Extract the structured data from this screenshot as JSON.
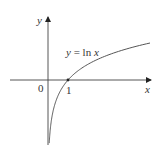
{
  "chart_data": {
    "type": "line",
    "title": "",
    "function": "y = ln x",
    "xlabel": "x",
    "ylabel": "y",
    "origin_label": "0",
    "x_ticks": [
      {
        "value": 1,
        "label": "1"
      }
    ],
    "annotation": {
      "text": "y = ln x"
    },
    "series": [
      {
        "name": "y = ln x",
        "x": [
          0.062,
          0.1,
          0.2,
          0.3,
          0.5,
          0.75,
          1,
          1.5,
          2,
          2.5,
          3,
          3.5,
          4,
          4.5,
          5.1
        ],
        "y": [
          -2.78,
          -2.3,
          -1.61,
          -1.2,
          -0.69,
          -0.29,
          0,
          0.41,
          0.69,
          0.92,
          1.1,
          1.25,
          1.39,
          1.5,
          1.63
        ]
      }
    ],
    "xlim": [
      -1.9,
      5.1
    ],
    "ylim": [
      -2.8,
      2.7
    ],
    "grid": false,
    "legend": "none"
  },
  "labels": {
    "y_axis": "y",
    "x_axis": "x",
    "origin": "0",
    "tick_one": "1",
    "equation_lhs": "y",
    "equation_eq": " = ",
    "equation_fn": "ln ",
    "equation_var": "x"
  },
  "colors": {
    "axis": "#333333",
    "curve": "#555555"
  }
}
